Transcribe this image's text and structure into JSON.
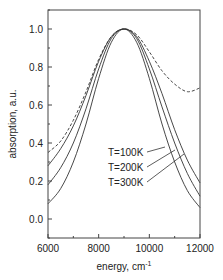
{
  "chart_data": {
    "type": "line",
    "title": "",
    "xlabel": "energy, cm",
    "xlabel_superscript": "-1",
    "ylabel": "absorption, a.u.",
    "xlim": [
      6000,
      12000
    ],
    "ylim": [
      -0.1,
      1.1
    ],
    "xticks": [
      6000,
      8000,
      10000,
      12000
    ],
    "yticks": [
      0.0,
      0.2,
      0.4,
      0.6,
      0.8,
      1.0
    ],
    "ytick_labels": [
      "0.0",
      "0.2",
      "0.4",
      "0.6",
      "0.8",
      "1.0"
    ],
    "grid": false,
    "legend_position": "inside, lower center, with pointer lines",
    "x": [
      6000,
      6500,
      7000,
      7500,
      8000,
      8500,
      9000,
      9500,
      10000,
      10500,
      11000,
      11500,
      12000
    ],
    "series": [
      {
        "name": "T=100K",
        "style": "solid",
        "values": [
          0.08,
          0.16,
          0.3,
          0.5,
          0.74,
          0.93,
          1.0,
          0.93,
          0.74,
          0.5,
          0.3,
          0.15,
          0.06
        ]
      },
      {
        "name": "T=200K",
        "style": "solid",
        "values": [
          0.18,
          0.27,
          0.4,
          0.58,
          0.79,
          0.95,
          1.0,
          0.95,
          0.79,
          0.59,
          0.4,
          0.24,
          0.12
        ]
      },
      {
        "name": "T=300K",
        "style": "solid",
        "values": [
          0.28,
          0.37,
          0.49,
          0.65,
          0.83,
          0.96,
          1.0,
          0.96,
          0.83,
          0.66,
          0.47,
          0.31,
          0.19
        ]
      },
      {
        "name": "experiment",
        "style": "dashed",
        "values": [
          0.35,
          0.41,
          0.52,
          0.67,
          0.84,
          0.96,
          1.0,
          0.97,
          0.88,
          0.78,
          0.71,
          0.67,
          0.69
        ]
      }
    ],
    "legend": [
      "T=100K",
      "T=200K",
      "T=300K"
    ]
  }
}
